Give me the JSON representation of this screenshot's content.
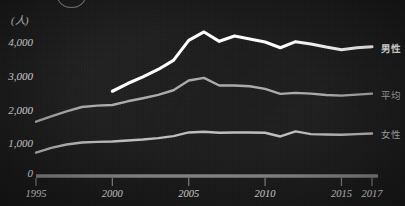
{
  "chart_data": {
    "type": "line",
    "title": "",
    "unit_label": "(人)",
    "xlabel": "",
    "ylabel": "",
    "x": [
      1995,
      1996,
      1997,
      1998,
      1999,
      2000,
      2001,
      2002,
      2003,
      2004,
      2005,
      2006,
      2007,
      2008,
      2009,
      2010,
      2011,
      2012,
      2013,
      2014,
      2015,
      2016,
      2017
    ],
    "xlim": [
      1995,
      2017
    ],
    "ylim": [
      0,
      4600
    ],
    "yticks": [
      0,
      1000,
      2000,
      3000,
      4000
    ],
    "ytick_labels": [
      "0",
      "1,000",
      "2,000",
      "3,000",
      "4,000"
    ],
    "xticks": [
      1995,
      2000,
      2005,
      2010,
      2015,
      2017
    ],
    "xtick_labels": [
      "1995",
      "2000",
      "2005",
      "2010",
      "2015",
      "2017"
    ],
    "grid": false,
    "legend_position": "right-inline",
    "series": [
      {
        "name": "男性",
        "color": "#fdfdfd",
        "x": [
          2000,
          2001,
          2002,
          2003,
          2004,
          2005,
          2006,
          2007,
          2008,
          2009,
          2010,
          2011,
          2012,
          2013,
          2014,
          2015,
          2016,
          2017
        ],
        "values": [
          2530,
          2760,
          2960,
          3180,
          3450,
          4050,
          4300,
          4020,
          4180,
          4090,
          4000,
          3830,
          4010,
          3940,
          3850,
          3770,
          3830,
          3860
        ]
      },
      {
        "name": "平均",
        "color": "#a9a9a9",
        "x": [
          1995,
          1996,
          1997,
          1998,
          1999,
          2000,
          2001,
          2002,
          2003,
          2004,
          2005,
          2006,
          2007,
          2008,
          2009,
          2010,
          2011,
          2012,
          2013,
          2014,
          2015,
          2016,
          2017
        ],
        "values": [
          1620,
          1780,
          1930,
          2060,
          2100,
          2120,
          2230,
          2320,
          2420,
          2560,
          2850,
          2930,
          2700,
          2700,
          2680,
          2600,
          2450,
          2480,
          2460,
          2420,
          2400,
          2430,
          2460
        ]
      },
      {
        "name": "女性",
        "color": "#bdbdbd",
        "x": [
          1995,
          1996,
          1997,
          1998,
          1999,
          2000,
          2001,
          2002,
          2003,
          2004,
          2005,
          2006,
          2007,
          2008,
          2009,
          2010,
          2011,
          2012,
          2013,
          2014,
          2015,
          2016,
          2017
        ],
        "values": [
          700,
          840,
          940,
          1000,
          1020,
          1030,
          1060,
          1090,
          1130,
          1190,
          1300,
          1320,
          1290,
          1300,
          1300,
          1290,
          1180,
          1330,
          1250,
          1240,
          1230,
          1250,
          1270
        ]
      }
    ]
  },
  "axis": {
    "baseline_color": "#8c8c8c",
    "tick_color": "#8c8c8c"
  }
}
